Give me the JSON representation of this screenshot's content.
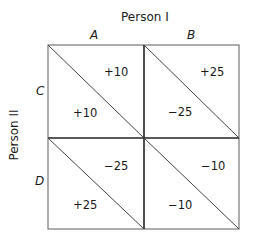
{
  "column_player": {
    "label": "Person I",
    "strategies": [
      "A",
      "B"
    ]
  },
  "row_player": {
    "label": "Person II",
    "strategies": [
      "C",
      "D"
    ]
  },
  "cells": [
    {
      "row": "C",
      "col": "A",
      "upper_right": "+10",
      "lower_left": "+10"
    },
    {
      "row": "C",
      "col": "B",
      "upper_right": "+25",
      "lower_left": "−25"
    },
    {
      "row": "D",
      "col": "A",
      "upper_right": "−25",
      "lower_left": "+25"
    },
    {
      "row": "D",
      "col": "B",
      "upper_right": "−10",
      "lower_left": "−10"
    }
  ],
  "colors": {
    "line": "#555555",
    "divider": "#222222",
    "text": "#1a1a1a"
  }
}
